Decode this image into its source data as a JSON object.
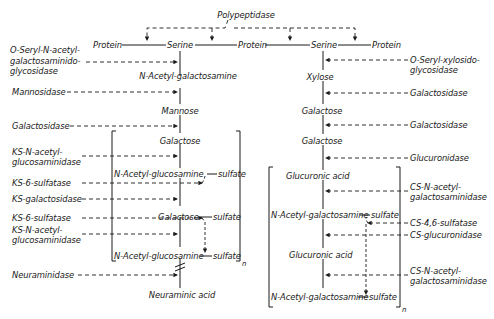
{
  "title": "Polypeptidase",
  "backbone": {
    "items": [
      "Protein",
      "Serine",
      "Protein",
      "Serine",
      "Protein"
    ]
  },
  "left_chain": {
    "sugars": [
      "N-Acetyl-galactosamine",
      "Mannose",
      "Galactose",
      "N-Acetyl-glucosamine",
      "Galactose",
      "N-Acetyl-glucosamine",
      "Neuraminic acid"
    ],
    "sulfates": [
      "sulfate",
      "sulfate",
      "sulfate"
    ],
    "repeat_subscript": "n",
    "enzymes": [
      "O-Seryl-N-acetyl-",
      "galactosaminido-",
      "glycosidase",
      "Mannosidase",
      "Galactosidase",
      "KS-N-acetyl-",
      "glucosaminidase",
      "KS-6-sulfatase",
      "KS-galactosidase",
      "KS-6-sulfatase",
      "KS-N-acetyl-",
      "glucosaminidase",
      "Neuraminidase"
    ]
  },
  "right_chain": {
    "sugars": [
      "Xylose",
      "Galactose",
      "Galactose",
      "Glucuronic acid",
      "N-Acetyl-galactosamine",
      "Glucuronic acid",
      "N-Acetyl-galactosamine"
    ],
    "sulfates": [
      "sulfate",
      "sulfate"
    ],
    "repeat_subscript": "n",
    "enzymes": [
      "O-Seryl-xylosido-",
      "glycosidase",
      "Galactosidase",
      "Galactosidase",
      "Glucuronidase",
      "CS-N-acetyl-",
      "galactosaminidase",
      "CS-4,6-sulfatase",
      "CS-glucuronidase",
      "CS-N-acetyl-",
      "galactosaminidase"
    ]
  },
  "colors": {
    "ink": "#1a1a1a",
    "background": "#ffffff"
  }
}
